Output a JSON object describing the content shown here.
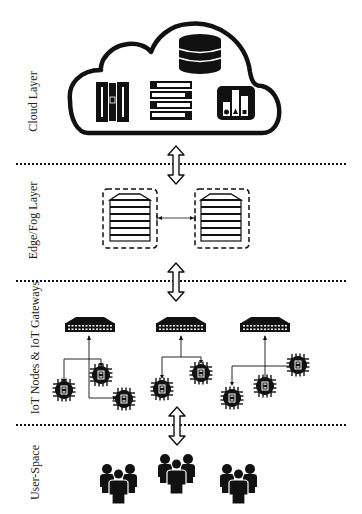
{
  "diagram": {
    "layers": [
      {
        "id": "cloud",
        "label": "Cloud Layer",
        "components": [
          "server-rack-icon",
          "storage-list-icon",
          "database-icon",
          "analytics-chart-icon"
        ]
      },
      {
        "id": "edge",
        "label": "Edge/Fog Layer",
        "components": [
          "fog-node-1",
          "fog-node-2"
        ],
        "link": "bidirectional"
      },
      {
        "id": "iot",
        "label": "IoT Nodes & IoT Gateways",
        "gateways": [
          {
            "name": "gateway-1",
            "nodes": 3
          },
          {
            "name": "gateway-2",
            "nodes": 2
          },
          {
            "name": "gateway-3",
            "nodes": 3
          }
        ],
        "node_chip_label": "IoT"
      },
      {
        "id": "user",
        "label": "User-Space",
        "components": [
          "user-group-1",
          "user-group-2",
          "user-group-3"
        ]
      }
    ],
    "connections": [
      "cloud<->edge",
      "edge<->iot",
      "iot<->user"
    ],
    "colors": {
      "ink": "#111111",
      "background": "#ffffff",
      "divider": "#111111"
    }
  }
}
